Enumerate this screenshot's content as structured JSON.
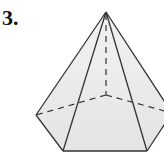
{
  "problem": {
    "number": "3."
  },
  "figure": {
    "type": "pentagonal pyramid",
    "fill": "#ececec",
    "stroke": "#333333",
    "apex": [
      106,
      12
    ],
    "base_vertices": {
      "left": [
        36,
        115
      ],
      "front_left": [
        63,
        151
      ],
      "front_right": [
        147,
        151
      ],
      "right": [
        172,
        113
      ],
      "back_hidden": [
        106,
        95
      ]
    }
  }
}
